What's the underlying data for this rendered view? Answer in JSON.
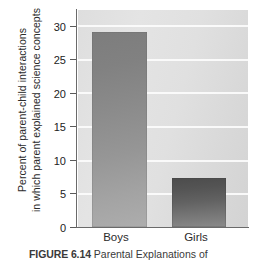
{
  "figure": {
    "caption_label": "FIGURE 6.14",
    "caption_text": "Parental Explanations of",
    "background_color": "#ffffff"
  },
  "chart_data": {
    "type": "bar",
    "title": "",
    "subtitle": "",
    "xlabel": "",
    "ylabel_line1": "Percent of parent-child interactions",
    "ylabel_line2": "in which parent explained science concepts",
    "categories": [
      "Boys",
      "Girls"
    ],
    "values": [
      29.0,
      7.2
    ],
    "series": [
      {
        "name": "Percent of parent-child interactions in which parent explained science concepts",
        "values": [
          29.0,
          7.2
        ]
      }
    ],
    "ylim": [
      0,
      32.2
    ],
    "yticks": [
      0,
      5,
      10,
      15,
      20,
      25,
      30
    ],
    "ytick_labels": [
      "0",
      "5",
      "10",
      "15",
      "20",
      "25",
      "30"
    ],
    "grid": true,
    "gridline_color": "#fbfbfb",
    "legend": null,
    "legend_position": "none",
    "annotations": [],
    "bar_colors": [
      "#8b8b8b",
      "#5a5a5a"
    ],
    "plot_background": "#e0e0e0",
    "axis_color": "#6a6a6a"
  }
}
